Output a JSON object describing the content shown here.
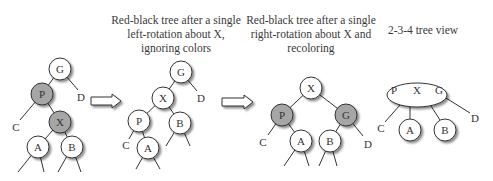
{
  "colors": {
    "red_node_fill": "#a6a6a6",
    "black_node_fill": "#ffffff",
    "stroke": "#333333",
    "shadow": "#9a9a9a",
    "text": "#333333"
  },
  "titles": [
    {
      "id": "left-rotation",
      "lines": [
        "Red-black tree after a single",
        "left-rotation about X,",
        "ignoring colors"
      ]
    },
    {
      "id": "right-rotation",
      "lines": [
        "Red-black tree after a single",
        "right-rotation about X and",
        "recoloring"
      ]
    },
    {
      "id": "234-view",
      "lines": [
        "2-3-4 tree view"
      ]
    }
  ],
  "diagrams": [
    {
      "name": "original-tree",
      "nodes": [
        {
          "label": "G",
          "x": 60,
          "y": 69,
          "shaded": false
        },
        {
          "label": "P",
          "x": 42,
          "y": 94,
          "shaded": true
        },
        {
          "label": "X",
          "x": 60,
          "y": 122,
          "shaded": true
        },
        {
          "label": "A",
          "x": 38,
          "y": 147,
          "shaded": false
        },
        {
          "label": "B",
          "x": 72,
          "y": 147,
          "shaded": false
        }
      ],
      "subtree_labels": [
        {
          "label": "D",
          "x": 81,
          "y": 97
        },
        {
          "label": "C",
          "x": 16,
          "y": 127
        }
      ]
    },
    {
      "name": "after-left-rotation",
      "nodes": [
        {
          "label": "G",
          "x": 181,
          "y": 72,
          "shaded": false
        },
        {
          "label": "X",
          "x": 163,
          "y": 98,
          "shaded": false
        },
        {
          "label": "P",
          "x": 139,
          "y": 121,
          "shaded": false
        },
        {
          "label": "B",
          "x": 180,
          "y": 123,
          "shaded": false
        },
        {
          "label": "A",
          "x": 148,
          "y": 148,
          "shaded": false
        }
      ],
      "subtree_labels": [
        {
          "label": "D",
          "x": 201,
          "y": 98
        },
        {
          "label": "C",
          "x": 126,
          "y": 145
        }
      ]
    },
    {
      "name": "after-right-rotation",
      "nodes": [
        {
          "label": "X",
          "x": 311,
          "y": 88,
          "shaded": false
        },
        {
          "label": "P",
          "x": 282,
          "y": 115,
          "shaded": true
        },
        {
          "label": "G",
          "x": 346,
          "y": 115,
          "shaded": true
        },
        {
          "label": "A",
          "x": 301,
          "y": 141,
          "shaded": false
        },
        {
          "label": "B",
          "x": 330,
          "y": 141,
          "shaded": false
        }
      ],
      "subtree_labels": [
        {
          "label": "C",
          "x": 263,
          "y": 142
        },
        {
          "label": "D",
          "x": 368,
          "y": 144
        }
      ]
    },
    {
      "name": "234-tree",
      "supernode": {
        "keys": [
          "P",
          "X",
          "G"
        ],
        "cx": 417,
        "cy": 95,
        "rx": 30,
        "ry": 12
      },
      "nodes": [
        {
          "label": "A",
          "x": 410,
          "y": 130,
          "shaded": false
        },
        {
          "label": "B",
          "x": 445,
          "y": 130,
          "shaded": false
        }
      ],
      "subtree_labels": [
        {
          "label": "C",
          "x": 381,
          "y": 128
        },
        {
          "label": "D",
          "x": 475,
          "y": 118
        }
      ]
    }
  ],
  "arrows": [
    {
      "name": "arrow-1",
      "x1": 91,
      "x2": 121,
      "y": 101
    },
    {
      "name": "arrow-2",
      "x1": 222,
      "x2": 253,
      "y": 102
    }
  ]
}
